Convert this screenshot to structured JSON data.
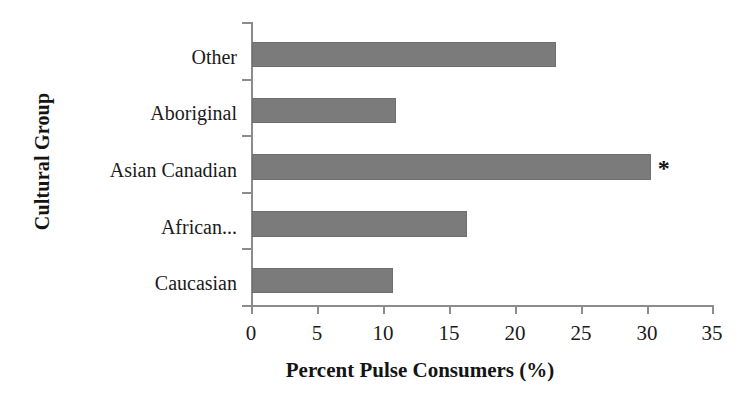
{
  "chart_data": {
    "type": "bar",
    "orientation": "horizontal",
    "title": "",
    "xlabel": "Percent Pulse Consumers (%)",
    "ylabel": "Cultural Group",
    "categories": [
      "Caucasian",
      "African...",
      "Asian Canadian",
      "Aboriginal",
      "Other"
    ],
    "values": [
      10.7,
      16.3,
      30.2,
      10.9,
      23.0
    ],
    "xlim": [
      0,
      35
    ],
    "xticks": [
      0,
      5,
      10,
      15,
      20,
      25,
      30,
      35
    ],
    "xtick_labels": [
      "0",
      "5",
      "10",
      "15",
      "20",
      "25",
      "30",
      "35"
    ],
    "grid": false,
    "legend": false,
    "bar_color": "#7b7b7b",
    "axis_color": "#8c8c8c",
    "annotations": [
      {
        "text": "*",
        "category": "Asian Canadian",
        "value": 30.2,
        "meaning": "significance-marker"
      }
    ]
  },
  "axes": {
    "y_title": "Cultural Group",
    "x_title": "Percent Pulse Consumers (%)"
  }
}
